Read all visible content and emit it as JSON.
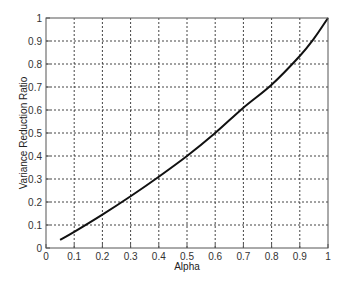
{
  "chart_data": {
    "type": "line",
    "title": "",
    "xlabel": "Alpha",
    "ylabel": "Variance Reduction Ratio",
    "xlim": [
      0,
      1
    ],
    "ylim": [
      0,
      1
    ],
    "grid": true,
    "legend": null,
    "x_ticks": [
      "0",
      "0.1",
      "0.2",
      "0.3",
      "0.4",
      "0.5",
      "0.6",
      "0.7",
      "0.8",
      "0.9",
      "1"
    ],
    "y_ticks": [
      "0",
      "0.1",
      "0.2",
      "0.3",
      "0.4",
      "0.5",
      "0.6",
      "0.7",
      "0.8",
      "0.9",
      "1"
    ],
    "series": [
      {
        "name": "Variance Reduction Ratio",
        "color": "#111111",
        "x": [
          0.05,
          0.1,
          0.2,
          0.3,
          0.4,
          0.5,
          0.6,
          0.7,
          0.8,
          0.9,
          0.95,
          1.0
        ],
        "values": [
          0.035,
          0.07,
          0.145,
          0.225,
          0.31,
          0.4,
          0.5,
          0.61,
          0.71,
          0.835,
          0.91,
          1.0
        ]
      }
    ]
  },
  "colors": {
    "axis": "#555555",
    "grid": "#444444",
    "line": "#111111",
    "background": "#ffffff"
  }
}
